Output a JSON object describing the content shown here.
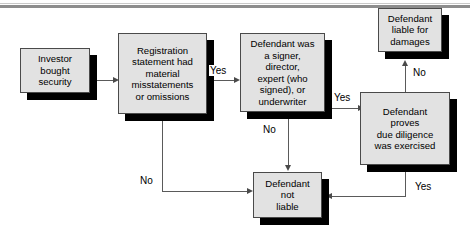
{
  "diagram": {
    "colors": {
      "node_fill": "#e2e2e2",
      "node_border": "#4a4a4a",
      "shadow": "#000000",
      "connector": "#5a5a5a",
      "rule": "#8d8d8d",
      "background": "#ffffff",
      "text": "#000000"
    },
    "nodes": [
      {
        "id": "investor-bought-security",
        "label": "Investor\nbought\nsecurity"
      },
      {
        "id": "registration-statement-misstatements",
        "label": "Registration\nstatement had\nmaterial\nmisstatements\nor omissions"
      },
      {
        "id": "defendant-was-signer",
        "label": "Defendant was\na signer,\ndirector,\nexpert (who\nsigned), or\nunderwriter"
      },
      {
        "id": "defendant-liable-for-damages",
        "label": "Defendant\nliable for\ndamages"
      },
      {
        "id": "defendant-proves-due-diligence",
        "label": "Defendant\nproves\ndue diligence\nwas exercised"
      },
      {
        "id": "defendant-not-liable",
        "label": "Defendant\nnot\nliable"
      }
    ],
    "edge_labels": {
      "registration_yes": "Yes",
      "registration_no": "No",
      "signer_yes": "Yes",
      "signer_no": "No",
      "due_diligence_no": "No",
      "due_diligence_yes": "Yes"
    }
  }
}
